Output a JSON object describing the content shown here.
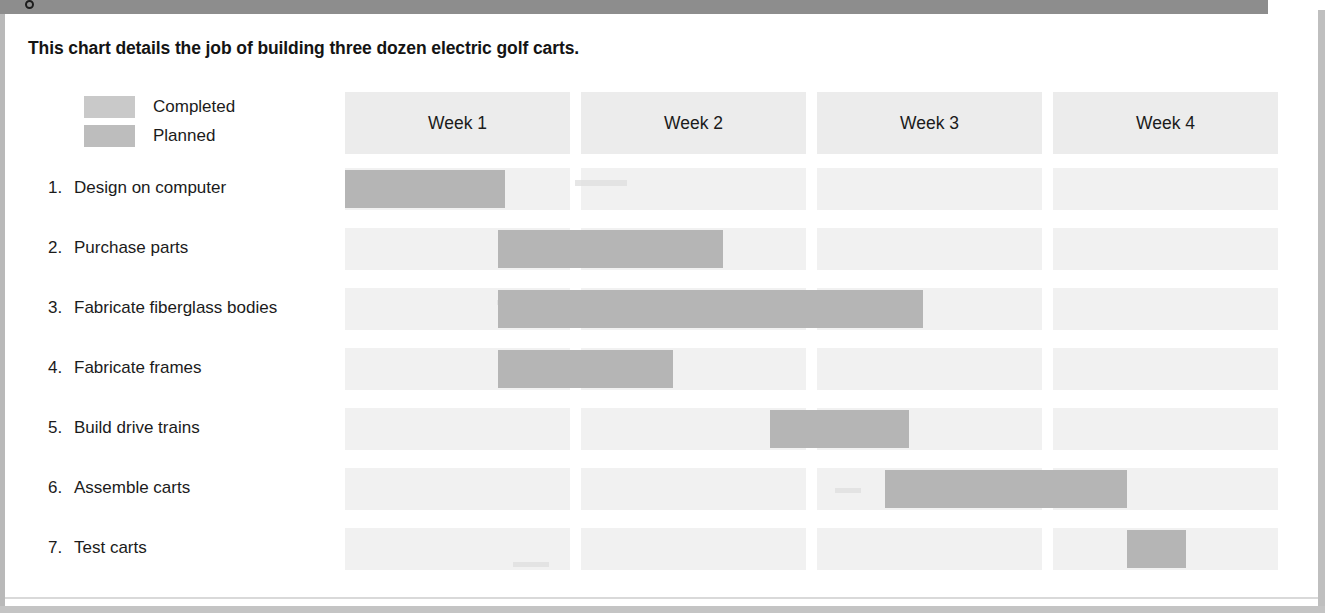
{
  "title": "This chart details the job of building three dozen electric golf carts.",
  "legend": {
    "items": [
      {
        "label": "Completed",
        "color": "#c9c9c9",
        "key": "completed"
      },
      {
        "label": "Planned",
        "color": "#bdbdbd",
        "key": "planned"
      }
    ]
  },
  "colors": {
    "bar": "#b5b5b5",
    "row_band": "#f1f1f1",
    "header_band": "#ececec",
    "text": "#1b1b1b",
    "frame": "#8d8d8d"
  },
  "chart_data": {
    "type": "bar",
    "chart_subtype": "gantt",
    "title": "This chart details the job of building three dozen electric golf carts.",
    "xlabel": "",
    "ylabel": "",
    "x_unit": "week",
    "xlim": [
      0,
      4
    ],
    "grid": true,
    "legend_position": "top-left",
    "columns": [
      "Week 1",
      "Week 2",
      "Week 3",
      "Week 4"
    ],
    "categories": [
      "1. Design on computer",
      "2. Purchase parts",
      "3. Fabricate fiberglass bodies",
      "4. Fabricate frames",
      "5. Build drive trains",
      "6. Assemble carts",
      "7. Test carts"
    ],
    "tasks": [
      {
        "number": "1.",
        "name": "Design on computer",
        "start_week": 0.0,
        "end_week": 0.71,
        "duration_weeks": 0.71,
        "status": "Completed"
      },
      {
        "number": "2.",
        "name": "Purchase parts",
        "start_week": 0.68,
        "end_week": 1.63,
        "duration_weeks": 0.95,
        "status": "Completed"
      },
      {
        "number": "3.",
        "name": "Fabricate fiberglass bodies",
        "start_week": 0.68,
        "end_week": 2.47,
        "duration_weeks": 1.79,
        "status": "Completed"
      },
      {
        "number": "4.",
        "name": "Fabricate frames",
        "start_week": 0.68,
        "end_week": 1.41,
        "duration_weeks": 0.73,
        "status": "Completed"
      },
      {
        "number": "5.",
        "name": "Build drive trains",
        "start_week": 1.84,
        "end_week": 2.41,
        "duration_weeks": 0.57,
        "status": "Completed"
      },
      {
        "number": "6.",
        "name": "Assemble carts",
        "start_week": 2.3,
        "end_week": 3.33,
        "duration_weeks": 1.03,
        "status": "Planned"
      },
      {
        "number": "7.",
        "name": "Test carts",
        "start_week": 3.33,
        "end_week": 3.59,
        "duration_weeks": 0.26,
        "status": "Planned"
      }
    ]
  }
}
